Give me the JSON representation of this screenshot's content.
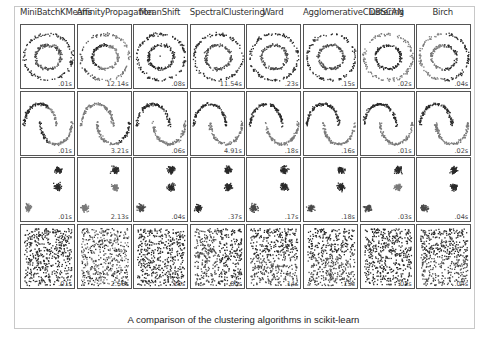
{
  "figure": {
    "caption": "A comparison of the clustering algorithms in scikit-learn",
    "columns": [
      "MiniBatchKMeans",
      "AffinityPropagation",
      "MeanShift",
      "SpectralClustering",
      "Ward",
      "AgglomerativeClustering",
      "DBSCAN",
      "Birch"
    ],
    "rows": [
      {
        "dataset": "noisy_circles",
        "timings": [
          ".01s",
          "12.14s",
          ".08s",
          "11.54s",
          ".23s",
          ".15s",
          ".02s",
          ".04s"
        ]
      },
      {
        "dataset": "noisy_moons",
        "timings": [
          ".01s",
          "3.21s",
          ".06s",
          "4.91s",
          ".18s",
          ".16s",
          ".01s",
          ".02s"
        ]
      },
      {
        "dataset": "blobs",
        "timings": [
          ".01s",
          "2.13s",
          ".04s",
          ".37s",
          ".17s",
          ".18s",
          ".03s",
          ".04s"
        ]
      },
      {
        "dataset": "no_structure",
        "timings": [
          ".01s",
          "2.56s",
          ".10s",
          ".80s",
          ".14s",
          ".15s",
          ".03s",
          ".04s"
        ]
      }
    ],
    "colors": {
      "cluster_a": "#2a2a2a",
      "cluster_b": "#7a7a7a",
      "cluster_c": "#4a4a4a",
      "frame": "#c8c8c8"
    }
  },
  "chart_data": {
    "type": "scatter",
    "title": "A comparison of the clustering algorithms in scikit-learn",
    "columns": [
      "MiniBatchKMeans",
      "AffinityPropagation",
      "MeanShift",
      "SpectralClustering",
      "Ward",
      "AgglomerativeClustering",
      "DBSCAN",
      "Birch"
    ],
    "datasets": [
      "noisy_circles",
      "noisy_moons",
      "blobs",
      "no_structure"
    ],
    "timings_seconds": [
      [
        0.01,
        12.14,
        0.08,
        11.54,
        0.23,
        0.15,
        0.02,
        0.04
      ],
      [
        0.01,
        3.21,
        0.06,
        4.91,
        0.18,
        0.16,
        0.01,
        0.02
      ],
      [
        0.01,
        2.13,
        0.04,
        0.37,
        0.17,
        0.18,
        0.03,
        0.04
      ],
      [
        0.01,
        2.56,
        0.1,
        0.8,
        0.14,
        0.15,
        0.03,
        0.04
      ]
    ],
    "grid": false,
    "axes_ticks": false
  }
}
